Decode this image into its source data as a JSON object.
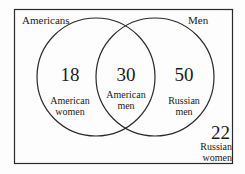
{
  "diagram": {
    "type": "venn",
    "universe_label": "",
    "sets": [
      {
        "name": "Americans",
        "label": "Americans"
      },
      {
        "name": "Men",
        "label": "Men"
      }
    ],
    "regions": [
      {
        "id": "americans_only",
        "value": "18",
        "line1": "American",
        "line2": "women"
      },
      {
        "id": "intersection",
        "value": "30",
        "line1": "American",
        "line2": "men"
      },
      {
        "id": "men_only",
        "value": "50",
        "line1": "Russian",
        "line2": "men"
      },
      {
        "id": "outside",
        "value": "22",
        "line1": "Russian",
        "line2": "women"
      }
    ],
    "colors": {
      "stroke": "#2a2a2a",
      "background": "#fdfdfd"
    }
  }
}
